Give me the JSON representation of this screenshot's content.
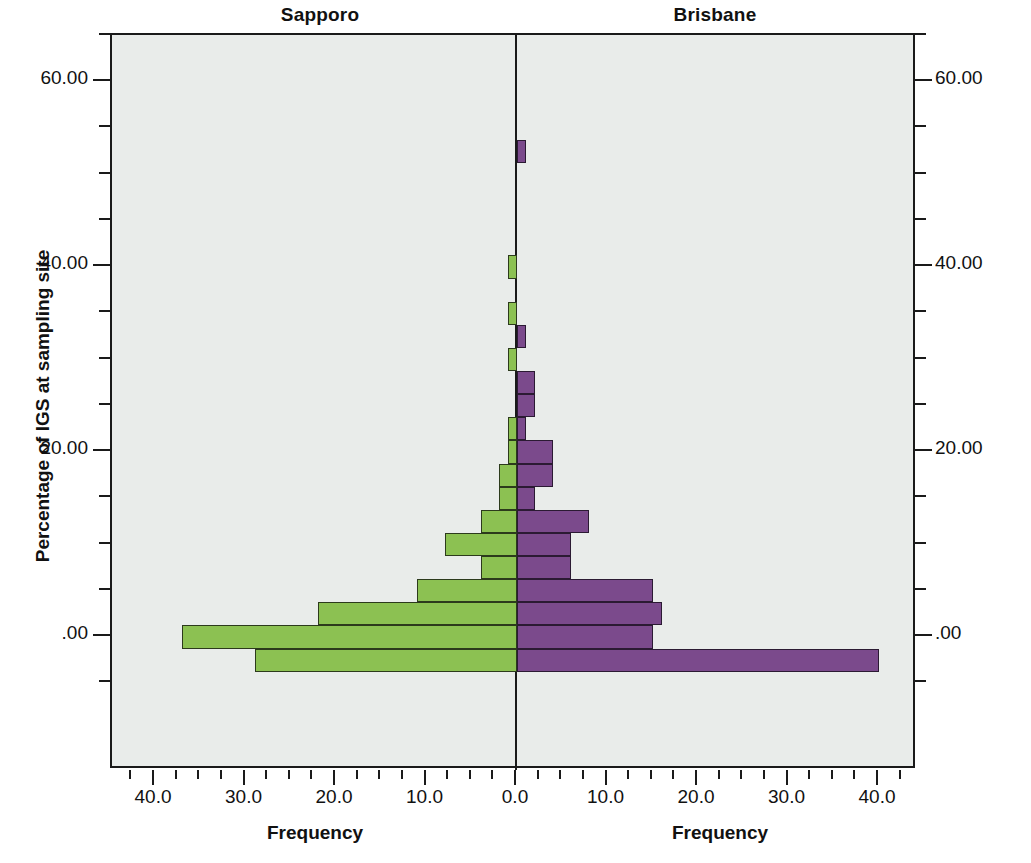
{
  "chart_data": {
    "type": "bar",
    "subtype": "population-pyramid-histogram",
    "title": "",
    "panels": [
      {
        "name": "left",
        "title": "Sapporo",
        "color": "#8cc152",
        "xlabel": "Frequency"
      },
      {
        "name": "right",
        "title": "Brisbane",
        "color": "#7b4a8c",
        "xlabel": "Frequency"
      }
    ],
    "ylabel": "Percentage of IGS at sampling site",
    "xlabel": "Frequency",
    "y_ticks": [
      ".00",
      "20.00",
      "40.00",
      "60.00"
    ],
    "y_tick_values": [
      0,
      20,
      40,
      60
    ],
    "ylim": [
      -5,
      65
    ],
    "x_ticks_left": [
      "40.0",
      "30.0",
      "20.0",
      "10.0",
      "0.0"
    ],
    "x_ticks_right": [
      "0.0",
      "10.0",
      "20.0",
      "30.0",
      "40.0"
    ],
    "xlim": [
      0,
      45
    ],
    "bin_width": 2.5,
    "grid": false,
    "legend": "none",
    "bins": [
      {
        "center": 52.5,
        "left": 0,
        "right": 1
      },
      {
        "center": 50.0,
        "left": 0,
        "right": 0
      },
      {
        "center": 47.5,
        "left": 0,
        "right": 0
      },
      {
        "center": 45.0,
        "left": 0,
        "right": 0
      },
      {
        "center": 42.5,
        "left": 0,
        "right": 0
      },
      {
        "center": 40.0,
        "left": 1,
        "right": 0
      },
      {
        "center": 37.5,
        "left": 0,
        "right": 0
      },
      {
        "center": 35.0,
        "left": 1,
        "right": 0
      },
      {
        "center": 32.5,
        "left": 0,
        "right": 1
      },
      {
        "center": 30.0,
        "left": 1,
        "right": 0
      },
      {
        "center": 27.5,
        "left": 0,
        "right": 2
      },
      {
        "center": 25.0,
        "left": 0,
        "right": 2
      },
      {
        "center": 22.5,
        "left": 1,
        "right": 1
      },
      {
        "center": 20.0,
        "left": 1,
        "right": 4
      },
      {
        "center": 17.5,
        "left": 2,
        "right": 4
      },
      {
        "center": 15.0,
        "left": 2,
        "right": 2
      },
      {
        "center": 12.5,
        "left": 4,
        "right": 8
      },
      {
        "center": 10.0,
        "left": 8,
        "right": 6
      },
      {
        "center": 7.5,
        "left": 4,
        "right": 6
      },
      {
        "center": 5.0,
        "left": 11,
        "right": 15
      },
      {
        "center": 2.5,
        "left": 22,
        "right": 16
      },
      {
        "center": 0.0,
        "left": 37,
        "right": 15
      },
      {
        "center": -2.5,
        "left": 29,
        "right": 40
      }
    ]
  },
  "titles": {
    "left_panel": "Sapporo",
    "right_panel": "Brisbane"
  },
  "axes": {
    "y_title_left": "Percentage of IGS at sampling site",
    "y_title_right": "Percentage of IGS at sampling site",
    "x_title_left": "Frequency",
    "x_title_right": "Frequency",
    "y_labels": [
      {
        "text": "60.00",
        "value": 60
      },
      {
        "text": "40.00",
        "value": 40
      },
      {
        "text": "20.00",
        "value": 20
      },
      {
        "text": ".00",
        "value": 0
      }
    ],
    "x_labels_left": [
      {
        "text": "40.0",
        "value": -40
      },
      {
        "text": "30.0",
        "value": -30
      },
      {
        "text": "20.0",
        "value": -20
      },
      {
        "text": "10.0",
        "value": -10
      }
    ],
    "x_labels_center": {
      "text": "0.0",
      "value": 0
    },
    "x_labels_right": [
      {
        "text": "10.0",
        "value": 10
      },
      {
        "text": "20.0",
        "value": 20
      },
      {
        "text": "30.0",
        "value": 30
      },
      {
        "text": "40.0",
        "value": 40
      }
    ]
  },
  "colors": {
    "left_bar": "#8cc152",
    "right_bar": "#7b4a8c",
    "plot_background": "#e9ecea",
    "axis": "#1a1a1a",
    "page_background": "#ffffff"
  }
}
